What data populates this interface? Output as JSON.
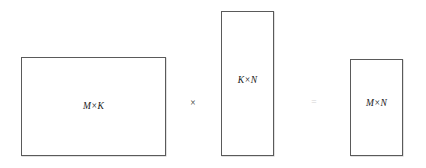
{
  "diagram": {
    "background_color": "#ffffff",
    "border_color": "#5a5a5a",
    "label_color": "#1a1a1a",
    "matrices": [
      {
        "id": "a",
        "label": "M×K",
        "role": "left-operand",
        "shape_description": "wide landscape rectangle",
        "x": 21,
        "y": 57,
        "width": 145,
        "height": 99
      },
      {
        "id": "b",
        "label": "K×N",
        "role": "right-operand",
        "shape_description": "tall narrow rectangle",
        "x": 221,
        "y": 11,
        "width": 53,
        "height": 145
      },
      {
        "id": "c",
        "label": "M×N",
        "role": "result",
        "shape_description": "short narrow rectangle",
        "x": 350,
        "y": 59,
        "width": 53,
        "height": 97
      }
    ],
    "operators": [
      {
        "id": "times",
        "symbol": "×",
        "name": "multiplication-sign",
        "color": "#2b2b2b",
        "x": 193,
        "y": 104
      },
      {
        "id": "equals",
        "symbol": "=",
        "name": "equals-sign",
        "color": "#d2d2d2",
        "x": 314,
        "y": 103
      }
    ]
  }
}
